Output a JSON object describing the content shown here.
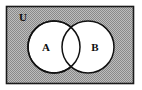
{
  "figure": {
    "type": "venn-diagram",
    "title": ""
  },
  "universe": {
    "label": "U",
    "label_x": 23,
    "label_y": 21,
    "rect": {
      "x": 6,
      "y": 6,
      "width": 128,
      "height": 78
    },
    "fill_color": "#a9a9a9",
    "stroke_color": "#1a1a1a",
    "pattern": "checkerboard-dither"
  },
  "sets": [
    {
      "name": "set-a",
      "label": "A",
      "cx": 54,
      "cy": 47,
      "r": 26,
      "label_x": 46,
      "label_y": 50,
      "fill_color": "#ffffff",
      "stroke_color": "#111111"
    },
    {
      "name": "set-b",
      "label": "B",
      "cx": 88,
      "cy": 47,
      "r": 26,
      "label_x": 95,
      "label_y": 50,
      "fill_color": "#ffffff",
      "stroke_color": "#111111"
    }
  ],
  "colors": {
    "page_background": "#ffffff",
    "shaded_region": "#a9a9a9",
    "circle_fill": "#ffffff",
    "ink": "#111111"
  }
}
